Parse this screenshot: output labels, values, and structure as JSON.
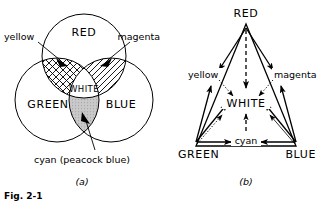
{
  "figure": {
    "caption": "Fig. 2-1",
    "panels": [
      {
        "id": "a",
        "caption": "(a)",
        "type": "venn-three-circle",
        "circles": [
          {
            "name": "red",
            "label": "RED",
            "cx": 84,
            "cy": 56,
            "r": 42
          },
          {
            "name": "green",
            "label": "GREEN",
            "cx": 57,
            "cy": 100,
            "r": 42
          },
          {
            "name": "blue",
            "label": "BLUE",
            "cx": 111,
            "cy": 100,
            "r": 42
          }
        ],
        "intersections": [
          {
            "name": "yellow",
            "label": "yellow",
            "fill": "cross-hatch",
            "pair": "red+green"
          },
          {
            "name": "magenta",
            "label": "magenta",
            "fill": "diagonal-hatch",
            "pair": "red+blue"
          },
          {
            "name": "cyan",
            "label": "cyan (peacock blue)",
            "fill": "gray-stipple",
            "pair": "green+blue"
          },
          {
            "name": "white",
            "label": "WHITE",
            "fill": "none",
            "pair": "red+green+blue"
          }
        ]
      },
      {
        "id": "b",
        "caption": "(b)",
        "type": "color-triangle",
        "vertices": [
          {
            "name": "red",
            "label": "RED",
            "x": 246,
            "y": 14
          },
          {
            "name": "green",
            "label": "GREEN",
            "x": 193,
            "y": 152
          },
          {
            "name": "blue",
            "label": "BLUE",
            "x": 299,
            "y": 152
          }
        ],
        "edge_midpoints": [
          {
            "name": "yellow",
            "label": "yellow",
            "x": 212,
            "y": 76
          },
          {
            "name": "magenta",
            "label": "magenta",
            "x": 282,
            "y": 76
          },
          {
            "name": "cyan",
            "label": "cyan",
            "x": 246,
            "y": 137
          }
        ],
        "center": {
          "name": "white",
          "label": "WHITE",
          "x": 246,
          "y": 104
        },
        "arrow_styles": {
          "primary_to_center": "solid",
          "red_to_center": "dashed",
          "secondary_to_center": "dotted",
          "vertex_to_midpoint": "solid"
        }
      }
    ]
  },
  "colors": {
    "ink": "#000000",
    "paper": "#ffffff",
    "cyan_fill": "#c9c9c9"
  }
}
